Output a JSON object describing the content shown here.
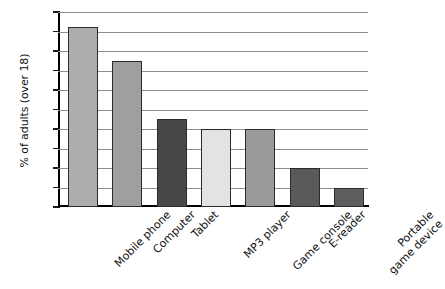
{
  "chart_data": {
    "type": "bar",
    "title": "",
    "xlabel": "",
    "ylabel": "% of adults (over 18)",
    "ylim": [
      0,
      100
    ],
    "ytick_step": 10,
    "grid": "horizontal",
    "legend": "none",
    "categories": [
      "Mobile phone",
      "Computer",
      "Tablet",
      "MP3 player",
      "Game console",
      "E-reader",
      "Portable game device"
    ],
    "values": [
      92.5,
      75,
      45,
      40,
      40,
      20,
      10
    ],
    "bar_colors": [
      "#adadad",
      "#9f9f9f",
      "#474747",
      "#e3e3e3",
      "#9a9a9a",
      "#5a5a5a",
      "#5e5e5e"
    ],
    "ytick_labels": [
      "100",
      "90",
      "80",
      "70",
      "60",
      "50",
      "40",
      "30",
      "20",
      "10",
      "0"
    ],
    "ytick_values": [
      100,
      90,
      80,
      70,
      60,
      50,
      40,
      30,
      20,
      10,
      0
    ],
    "category_label_lines": [
      [
        "Mobile phone"
      ],
      [
        "Computer"
      ],
      [
        "Tablet"
      ],
      [
        "MP3 player"
      ],
      [
        "Game console"
      ],
      [
        "E-reader"
      ],
      [
        "Portable",
        "game device"
      ]
    ],
    "axis_color": "#000000",
    "gridline_color": "#8e8e8e",
    "bar_outline_color": "#2b2b2b",
    "background": "#ffffff"
  }
}
